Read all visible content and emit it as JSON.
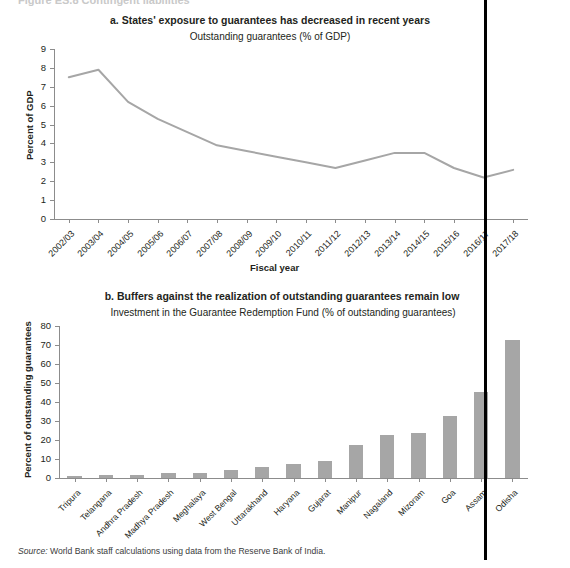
{
  "figure": {
    "cut_header": "Figure ES.8  Contingent liabilities",
    "source_prefix": "Source:",
    "source_text": " World Bank staff calculations using data from the Reserve Bank of India."
  },
  "chart_data": [
    {
      "type": "line",
      "panel": "a",
      "title": "a. States' exposure to guarantees has decreased in recent years",
      "subtitle": "Outstanding guarantees (% of GDP)",
      "xlabel": "Fiscal year",
      "ylabel": "Percent of GDP",
      "ylim": [
        0,
        9
      ],
      "yticks": [
        0,
        1,
        2,
        3,
        4,
        5,
        6,
        7,
        8,
        9
      ],
      "grid": false,
      "legend": "none",
      "line_color": "#a6a6a6",
      "categories": [
        "2002/03",
        "2003/04",
        "2004/05",
        "2005/06",
        "2006/07",
        "2007/08",
        "2008/09",
        "2009/10",
        "2010/11",
        "2011/12",
        "2012/13",
        "2013/14",
        "2014/15",
        "2015/16",
        "2016/17",
        "2017/18"
      ],
      "values": [
        7.5,
        7.9,
        6.2,
        5.3,
        4.6,
        3.9,
        3.6,
        3.3,
        3.0,
        2.7,
        3.1,
        3.5,
        3.5,
        2.7,
        2.2,
        2.6
      ]
    },
    {
      "type": "bar",
      "panel": "b",
      "title": "b. Buffers against the realization of outstanding guarantees remain low",
      "subtitle": "Investment in the Guarantee Redemption Fund (% of outstanding guarantees)",
      "xlabel": "",
      "ylabel": "Percent of outstanding guarantees",
      "ylim": [
        0,
        80
      ],
      "yticks": [
        0,
        10,
        20,
        30,
        40,
        50,
        60,
        70,
        80
      ],
      "grid": false,
      "legend": "none",
      "bar_color": "#a6a6a6",
      "categories": [
        "Tripura",
        "Telangana",
        "Andhra Pradesh",
        "Madhya Pradesh",
        "Meghalaya",
        "West Bengal",
        "Uttarakhand",
        "Haryana",
        "Gujarat",
        "Manipur",
        "Nagaland",
        "Mizoram",
        "Goa",
        "Assam",
        "Odisha"
      ],
      "values": [
        0.8,
        1.6,
        1.8,
        2.6,
        2.6,
        4.2,
        6.0,
        7.3,
        9.2,
        17.5,
        22.5,
        23.5,
        32.5,
        45.5,
        72.5
      ]
    }
  ]
}
